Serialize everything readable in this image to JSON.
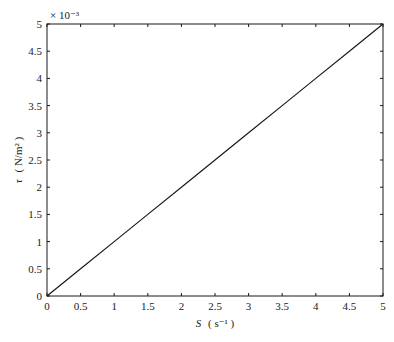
{
  "chart_data": {
    "type": "line",
    "title": "",
    "xlabel": "S ( s⁻¹ )",
    "xlabel_var": "S",
    "xlabel_unit": "( s⁻¹ )",
    "ylabel": "τ ( N/m² )",
    "ylabel_var": "τ",
    "ylabel_unit": "( N/m² )",
    "y_multiplier": "× 10⁻³",
    "xlim": [
      0,
      5
    ],
    "ylim": [
      0,
      5
    ],
    "x_ticks": [
      "0",
      "0.5",
      "1",
      "1.5",
      "2",
      "2.5",
      "3",
      "3.5",
      "4",
      "4.5",
      "5"
    ],
    "y_ticks": [
      "0",
      "0.5",
      "1",
      "1.5",
      "2",
      "2.5",
      "3",
      "3.5",
      "4",
      "4.5",
      "5"
    ],
    "grid": false,
    "legend": null,
    "series": [
      {
        "name": "tau vs S",
        "x": [
          0,
          0.5,
          1,
          1.5,
          2,
          2.5,
          3,
          3.5,
          4,
          4.5,
          5
        ],
        "y": [
          0,
          0.5,
          1,
          1.5,
          2,
          2.5,
          3,
          3.5,
          4,
          4.5,
          5
        ],
        "y_scale": 0.001,
        "color": "#1a1a1a"
      }
    ]
  }
}
